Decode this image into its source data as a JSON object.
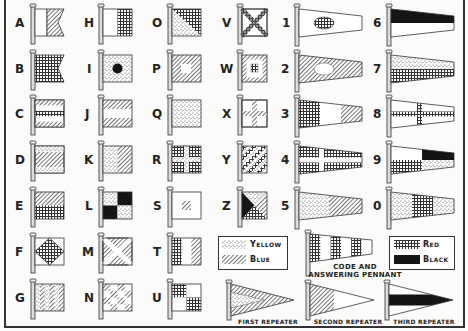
{
  "letters": [
    {
      "label": "A",
      "design": "white hoist, blue swallowtail fly"
    },
    {
      "label": "B",
      "design": "red swallowtail"
    },
    {
      "label": "C",
      "design": "blue-white-red-white-blue horizontal stripes"
    },
    {
      "label": "D",
      "design": "yellow-blue-yellow horizontal"
    },
    {
      "label": "E",
      "design": "blue over red"
    },
    {
      "label": "F",
      "design": "red diamond on white"
    },
    {
      "label": "G",
      "design": "yellow and blue vertical stripes"
    },
    {
      "label": "H",
      "design": "white and red vertical halves"
    },
    {
      "label": "I",
      "design": "black circle on yellow"
    },
    {
      "label": "J",
      "design": "blue-white-blue horizontal"
    },
    {
      "label": "K",
      "design": "yellow and blue vertical halves"
    },
    {
      "label": "L",
      "design": "yellow and black quarters"
    },
    {
      "label": "M",
      "design": "white saltire on blue"
    },
    {
      "label": "N",
      "design": "blue and white checkers"
    },
    {
      "label": "O",
      "design": "red and yellow diagonal"
    },
    {
      "label": "P",
      "design": "white square on blue"
    },
    {
      "label": "Q",
      "design": "yellow"
    },
    {
      "label": "R",
      "design": "yellow cross on red"
    },
    {
      "label": "S",
      "design": "blue square on white"
    },
    {
      "label": "T",
      "design": "red-white-blue vertical"
    },
    {
      "label": "U",
      "design": "red and white quarters"
    },
    {
      "label": "V",
      "design": "red saltire on white"
    },
    {
      "label": "W",
      "design": "blue, white, red concentric squares"
    },
    {
      "label": "X",
      "design": "blue cross on white"
    },
    {
      "label": "Y",
      "design": "yellow and red diagonal stripes"
    },
    {
      "label": "Z",
      "design": "yellow, blue, red, black triangles"
    }
  ],
  "numerals": [
    {
      "label": "1",
      "design": "red disc on white pennant"
    },
    {
      "label": "2",
      "design": "white disc on blue pennant"
    },
    {
      "label": "3",
      "design": "red-white-blue pennant"
    },
    {
      "label": "4",
      "design": "white cross on red pennant"
    },
    {
      "label": "5",
      "design": "yellow and blue pennant"
    },
    {
      "label": "6",
      "design": "black over white pennant"
    },
    {
      "label": "7",
      "design": "yellow over red pennant"
    },
    {
      "label": "8",
      "design": "red cross on white pennant"
    },
    {
      "label": "9",
      "design": "white, black, red, yellow quarters pennant"
    },
    {
      "label": "0",
      "design": "yellow-red-yellow pennant"
    }
  ],
  "legend_left": [
    {
      "label": "Yellow",
      "pattern": "stipple"
    },
    {
      "label": "Blue",
      "pattern": "diagonal hatch"
    }
  ],
  "legend_right": [
    {
      "label": "Red",
      "pattern": "crosshatch grid"
    },
    {
      "label": "Black",
      "pattern": "solid"
    }
  ],
  "code_pennant_caption_1": "CODE AND",
  "code_pennant_caption_2": "ANSWERING PENNANT",
  "repeaters": [
    {
      "label": "FIRST REPEATER"
    },
    {
      "label": "SECOND REPEATER"
    },
    {
      "label": "THIRD REPEATER"
    }
  ],
  "colors": {
    "ink": "#2a2a2a",
    "paper": "#fbfbf9"
  }
}
